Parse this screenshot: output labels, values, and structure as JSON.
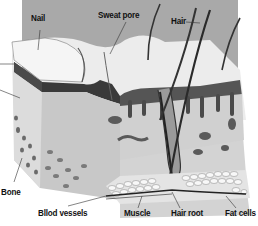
{
  "diagram": {
    "style": "grayscale illustration",
    "colors": {
      "background_panel": "#a9a9a9",
      "page": "#ffffff",
      "skin_surface": "#ececec",
      "dermis": "#c8c8c8",
      "dark_layer": "#3a3a3a",
      "fat_cells": "#f2f2f2",
      "label_text": "#111111"
    },
    "labels": [
      {
        "id": "nail",
        "text": "Nail"
      },
      {
        "id": "sweat-pore",
        "text": "Sweat pore"
      },
      {
        "id": "hair",
        "text": "Hair"
      },
      {
        "id": "bone",
        "text": "Bone"
      },
      {
        "id": "blood-vessels",
        "text": "Bllod vessels"
      },
      {
        "id": "muscle",
        "text": "Muscle"
      },
      {
        "id": "hair-root",
        "text": "Hair root"
      },
      {
        "id": "fat-cells",
        "text": "Fat cells"
      }
    ]
  }
}
